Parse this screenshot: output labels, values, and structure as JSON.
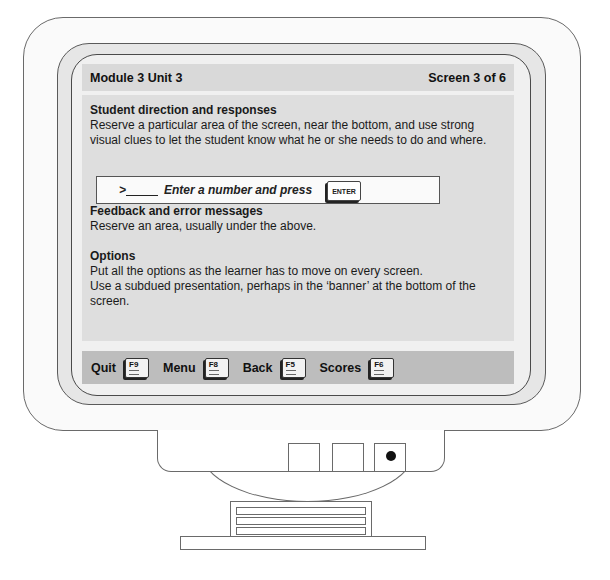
{
  "header": {
    "module": "Module 3 Unit 3",
    "screen_counter": "Screen 3 of 6"
  },
  "sections": [
    {
      "title": "Student direction and responses",
      "body": "Reserve a particular area of the screen, near the bottom, and use strong visual clues to let the student know what he or she needs to do and where."
    },
    {
      "title": "Feedback and error messages",
      "body": "Reserve an area, usually under the above."
    },
    {
      "title": "Options",
      "body_lines": [
        "Put all the options as the learner has to move on every screen.",
        "Use a subdued presentation, perhaps in the ‘banner’ at the bottom of the screen."
      ]
    }
  ],
  "prompt": {
    "prefix": ">",
    "text": "Enter a number and press",
    "key_label": "ENTER",
    "key_icon": "enter-key-icon"
  },
  "banner": {
    "items": [
      {
        "label": "Quit",
        "key": "F9",
        "icon": "f9-key-icon"
      },
      {
        "label": "Menu",
        "key": "F8",
        "icon": "f8-key-icon"
      },
      {
        "label": "Back",
        "key": "F5",
        "icon": "f5-key-icon"
      },
      {
        "label": "Scores",
        "key": "F6",
        "icon": "f6-key-icon"
      }
    ]
  },
  "colors": {
    "header_bg": "#d9d9d9",
    "content_bg": "#dedede",
    "banner_bg": "#bdbdbd",
    "bezel": "#e6e6e6"
  }
}
